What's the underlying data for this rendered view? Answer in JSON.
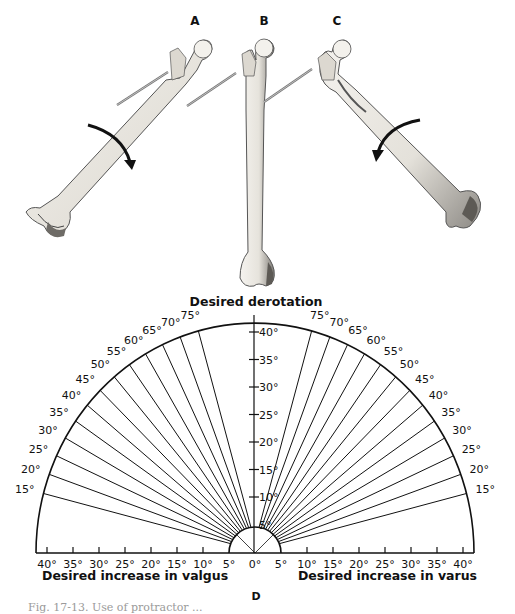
{
  "figure": {
    "panels": [
      {
        "id": "A",
        "label": "A",
        "description": "Femur rotated with pin in neck, curved arrow indicating rotation"
      },
      {
        "id": "B",
        "label": "B",
        "description": "Femur in neutral position with pin in neck"
      },
      {
        "id": "C",
        "label": "C",
        "description": "Femur rotated opposite with pin in neck, curved arrow indicating rotation"
      }
    ],
    "protractor": {
      "panel_label": "D",
      "title": "Desired derotation",
      "left_axis_label": "Desired increase in valgus",
      "right_axis_label": "Desired increase in varus",
      "arc_labels_left": [
        "15°",
        "20°",
        "25°",
        "30°",
        "35°",
        "40°",
        "45°",
        "50°",
        "55°",
        "60°",
        "65°",
        "70°",
        "75°"
      ],
      "arc_labels_right": [
        "75°",
        "70°",
        "65°",
        "60°",
        "55°",
        "50°",
        "45°",
        "40°",
        "35°",
        "30°",
        "25°",
        "20°",
        "15°"
      ],
      "arc_angles": [
        15,
        20,
        25,
        30,
        35,
        40,
        45,
        50,
        55,
        60,
        65,
        70,
        75
      ],
      "vertical_labels": [
        "40°",
        "35°",
        "30°",
        "25°",
        "20°",
        "15°",
        "10°",
        "5°"
      ],
      "vertical_values": [
        40,
        35,
        30,
        25,
        20,
        15,
        10,
        5
      ],
      "baseline_labels_left": [
        "40°",
        "35°",
        "30°",
        "25°",
        "20°",
        "15°",
        "10°",
        "5°"
      ],
      "baseline_center_label": "0°",
      "baseline_labels_right": [
        "5°",
        "10°",
        "15°",
        "20°",
        "25°",
        "30°",
        "35°",
        "40°"
      ]
    },
    "caption": "Fig. 17-13. Use of protractor ..."
  },
  "colors": {
    "ink": "#111111",
    "bone_fill": "#efece6",
    "bone_shade": "#6b6b6b",
    "pin": "#777777",
    "background": "#ffffff"
  }
}
